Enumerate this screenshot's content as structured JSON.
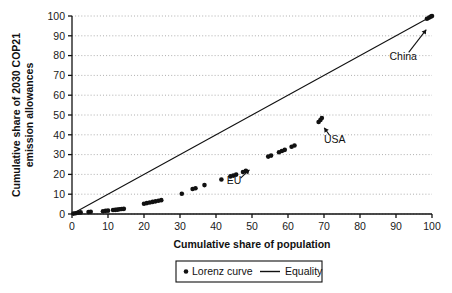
{
  "chart_data": {
    "type": "scatter",
    "title": "",
    "xlabel": "Cumulative share of population",
    "ylabel": "Cumulative share of 2030 COP21 emission allowances",
    "ylabel_line1": "Cumulative share of 2030 COP21",
    "ylabel_line2": "emission allowances",
    "xlim": [
      0,
      100
    ],
    "ylim": [
      0,
      100
    ],
    "xticks": [
      0,
      10,
      20,
      30,
      40,
      50,
      60,
      70,
      80,
      90,
      100
    ],
    "yticks": [
      0,
      10,
      20,
      30,
      40,
      50,
      60,
      70,
      80,
      90,
      100
    ],
    "xtick_labels": [
      "0",
      "10",
      "20",
      "30",
      "40",
      "50",
      "60",
      "70",
      "80",
      "90",
      "100"
    ],
    "ytick_labels": [
      "0",
      "10",
      "20",
      "30",
      "40",
      "50",
      "60",
      "70",
      "80",
      "90",
      "100"
    ],
    "grid": "horizontal-dotted",
    "legend_position": "below-axis",
    "series": [
      {
        "name": "Lorenz curve",
        "type": "scatter",
        "marker": "dot",
        "color": "#111111",
        "points": [
          [
            0.4,
            0.2
          ],
          [
            1.0,
            0.4
          ],
          [
            1.7,
            0.6
          ],
          [
            2.4,
            0.8
          ],
          [
            4.6,
            1.0
          ],
          [
            5.2,
            1.1
          ],
          [
            8.6,
            1.4
          ],
          [
            9.3,
            1.6
          ],
          [
            10.0,
            1.7
          ],
          [
            11.4,
            2.0
          ],
          [
            12.0,
            2.1
          ],
          [
            12.6,
            2.2
          ],
          [
            13.2,
            2.4
          ],
          [
            13.8,
            2.5
          ],
          [
            14.4,
            2.6
          ],
          [
            20.0,
            5.2
          ],
          [
            20.8,
            5.5
          ],
          [
            21.6,
            5.8
          ],
          [
            22.4,
            6.1
          ],
          [
            23.2,
            6.4
          ],
          [
            24.0,
            6.7
          ],
          [
            24.8,
            7.0
          ],
          [
            30.5,
            10.2
          ],
          [
            33.5,
            12.6
          ],
          [
            34.3,
            13.0
          ],
          [
            36.8,
            14.6
          ],
          [
            41.5,
            17.4
          ],
          [
            44.0,
            19.0
          ],
          [
            44.8,
            19.4
          ],
          [
            45.6,
            19.9
          ],
          [
            47.5,
            21.2
          ],
          [
            48.3,
            21.8
          ],
          [
            54.5,
            29.0
          ],
          [
            55.3,
            29.5
          ],
          [
            57.5,
            31.2
          ],
          [
            58.3,
            31.8
          ],
          [
            59.1,
            32.4
          ],
          [
            61.0,
            34.0
          ],
          [
            61.8,
            34.6
          ],
          [
            68.5,
            46.5
          ],
          [
            69.0,
            47.5
          ],
          [
            69.4,
            48.5
          ],
          [
            98.6,
            98.6
          ],
          [
            99.2,
            99.2
          ],
          [
            99.7,
            99.7
          ],
          [
            100.0,
            100.0
          ]
        ]
      },
      {
        "name": "Equality",
        "type": "line",
        "color": "#111111",
        "points": [
          [
            0,
            0
          ],
          [
            100,
            100
          ]
        ]
      }
    ],
    "annotations": [
      {
        "text": "EU",
        "label_x": 45.0,
        "label_y": 15.0,
        "point_x": 50.0,
        "point_y": 23.5
      },
      {
        "text": "USA",
        "label_x": 73.0,
        "label_y": 36.0,
        "point_x": 69.5,
        "point_y": 45.0
      },
      {
        "text": "China",
        "label_x": 92.0,
        "label_y": 78.0,
        "point_x": 99.0,
        "point_y": 94.5
      }
    ],
    "legend": [
      {
        "label": "Lorenz curve",
        "marker": "dot"
      },
      {
        "label": "Equality",
        "marker": "line"
      }
    ]
  }
}
